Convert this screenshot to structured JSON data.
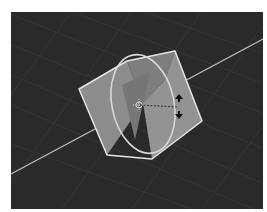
{
  "viewport": {
    "name": "3D Viewport",
    "background_color": "#2a2a2a",
    "grid_color": "#353535",
    "axis_line_color": "#b8b8b8"
  },
  "scene": {
    "selected_object": "Cube",
    "object_face_color": "#8a8a8a",
    "object_outline_color": "#e6e6e6",
    "gizmo": {
      "type": "rotate",
      "ring_color": "#d8d8d8",
      "cursor_icon": "rotate-arrows-icon"
    }
  }
}
